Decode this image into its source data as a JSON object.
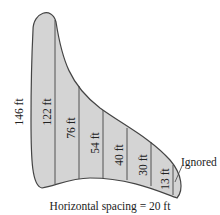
{
  "diagram": {
    "type": "cross-section / area estimation by vertical strips",
    "shape_fill": "#d4d4d4",
    "outline_color": "#444444",
    "left_edge_label": "146 ft",
    "measurements": [
      {
        "label": "122 ft"
      },
      {
        "label": "76 ft"
      },
      {
        "label": "54 ft"
      },
      {
        "label": "40 ft"
      },
      {
        "label": "30 ft"
      },
      {
        "label": "13 ft"
      }
    ],
    "ignored_label": "Ignored",
    "caption": "Horizontal spacing = 20 ft"
  }
}
